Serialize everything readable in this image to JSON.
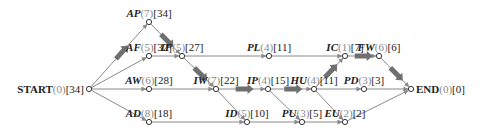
{
  "diagram": {
    "type": "activity-network",
    "colors": {
      "edge": "#8a8a8a",
      "critical_arrow": "#6f6f6f",
      "duration": "#888888",
      "text": "#222222"
    },
    "nodes": [
      {
        "id": "START",
        "name": "START",
        "duration": "(0)",
        "value": "[34]",
        "x": 89,
        "y": 89,
        "italic": false
      },
      {
        "id": "AP",
        "name": "AP",
        "duration": "(7)",
        "value": "[34]",
        "x": 149,
        "y": 22,
        "italic": true
      },
      {
        "id": "AF",
        "name": "AF",
        "duration": "(5)",
        "value": "[32]",
        "x": 149,
        "y": 56,
        "italic": true
      },
      {
        "id": "AW",
        "name": "AW",
        "duration": "(6)",
        "value": "[28]",
        "x": 149,
        "y": 89,
        "italic": true
      },
      {
        "id": "AD",
        "name": "AD",
        "duration": "(8)",
        "value": "[18]",
        "x": 149,
        "y": 122,
        "italic": true
      },
      {
        "id": "IF",
        "name": "IF",
        "duration": "(5)",
        "value": "[27]",
        "x": 182,
        "y": 56,
        "italic": true
      },
      {
        "id": "PL",
        "name": "PL",
        "duration": "(4)",
        "value": "[11]",
        "x": 269,
        "y": 56,
        "italic": true
      },
      {
        "id": "IW",
        "name": "IW",
        "duration": "(7)",
        "value": "[22]",
        "x": 216,
        "y": 89,
        "italic": true
      },
      {
        "id": "IP",
        "name": "IP",
        "duration": "(4)",
        "value": "[15]",
        "x": 268,
        "y": 89,
        "italic": true
      },
      {
        "id": "HU",
        "name": "HU",
        "duration": "(4)",
        "value": "[11]",
        "x": 314,
        "y": 89,
        "italic": true
      },
      {
        "id": "IC",
        "name": "IC",
        "duration": "(1)",
        "value": "[7]",
        "x": 345,
        "y": 56,
        "italic": true
      },
      {
        "id": "FW",
        "name": "FW",
        "duration": "(6)",
        "value": "[6]",
        "x": 379,
        "y": 56,
        "italic": true
      },
      {
        "id": "PD",
        "name": "PD",
        "duration": "(3)",
        "value": "[3]",
        "x": 364,
        "y": 89,
        "italic": true
      },
      {
        "id": "END",
        "name": "END",
        "duration": "(0)",
        "value": "[0]",
        "x": 411,
        "y": 89,
        "italic": false
      },
      {
        "id": "ID",
        "name": "ID",
        "duration": "(5)",
        "value": "[10]",
        "x": 247,
        "y": 122,
        "italic": true
      },
      {
        "id": "PU",
        "name": "PU",
        "duration": "(3)",
        "value": "[5]",
        "x": 302,
        "y": 122,
        "italic": true
      },
      {
        "id": "EU",
        "name": "EU",
        "duration": "(2)",
        "value": "[2]",
        "x": 345,
        "y": 122,
        "italic": true
      }
    ],
    "edges": [
      {
        "from": "START",
        "to": "AP",
        "critical": true
      },
      {
        "from": "START",
        "to": "AF",
        "critical": false
      },
      {
        "from": "START",
        "to": "AW",
        "critical": false
      },
      {
        "from": "START",
        "to": "AD",
        "critical": false
      },
      {
        "from": "AP",
        "to": "IF",
        "critical": true
      },
      {
        "from": "AF",
        "to": "IF",
        "critical": false
      },
      {
        "from": "IF",
        "to": "PL",
        "critical": false
      },
      {
        "from": "IF",
        "to": "IW",
        "critical": true
      },
      {
        "from": "AW",
        "to": "IW",
        "critical": false
      },
      {
        "from": "AD",
        "to": "ID",
        "critical": false
      },
      {
        "from": "IW",
        "to": "IP",
        "critical": true
      },
      {
        "from": "IW",
        "to": "ID",
        "critical": false
      },
      {
        "from": "IP",
        "to": "HU",
        "critical": true
      },
      {
        "from": "IP",
        "to": "PU",
        "critical": false
      },
      {
        "from": "PL",
        "to": "IC",
        "critical": false
      },
      {
        "from": "HU",
        "to": "IC",
        "critical": true
      },
      {
        "from": "HU",
        "to": "PD",
        "critical": false
      },
      {
        "from": "HU",
        "to": "EU",
        "critical": false
      },
      {
        "from": "ID",
        "to": "PU",
        "critical": false
      },
      {
        "from": "PU",
        "to": "EU",
        "critical": false
      },
      {
        "from": "IC",
        "to": "FW",
        "critical": true
      },
      {
        "from": "FW",
        "to": "END",
        "critical": true
      },
      {
        "from": "PD",
        "to": "END",
        "critical": false
      },
      {
        "from": "EU",
        "to": "END",
        "critical": false
      }
    ]
  }
}
